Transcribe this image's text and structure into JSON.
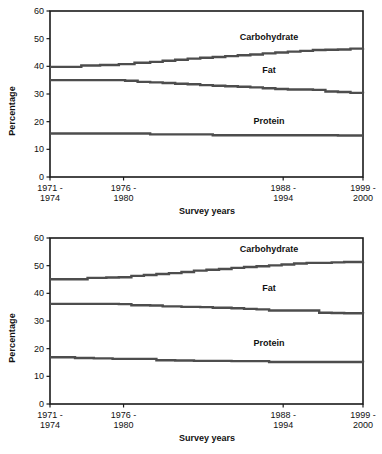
{
  "figure": {
    "panels": [
      {
        "id": "top",
        "chart_data": {
          "type": "line",
          "title": "",
          "xlabel": "Survey years",
          "ylabel": "Percentage",
          "ylim": [
            0,
            60
          ],
          "yticks": [
            0,
            10,
            20,
            30,
            40,
            50,
            60
          ],
          "grid": false,
          "legend_position": "inline-right",
          "categories": [
            "1971 - 1974",
            "1976 - 1980",
            "1988 - 1994",
            "1999 - 2000"
          ],
          "xtick_positions": [
            0.0,
            0.235,
            0.745,
            1.0
          ],
          "annotations": [
            {
              "text": "Carbohydrate",
              "x": 0.7,
              "y": 49.5
            },
            {
              "text": "Fat",
              "x": 0.7,
              "y": 37.5
            },
            {
              "text": "Protein",
              "x": 0.7,
              "y": 19.0
            }
          ],
          "series": [
            {
              "name": "Carbohydrate",
              "color": "#4d4d4d",
              "x": [
                0.0,
                0.06,
                0.1,
                0.16,
                0.22,
                0.27,
                0.32,
                0.36,
                0.4,
                0.44,
                0.48,
                0.52,
                0.56,
                0.6,
                0.64,
                0.68,
                0.72,
                0.76,
                0.8,
                0.84,
                0.88,
                0.92,
                0.96,
                1.0
              ],
              "values": [
                39.8,
                39.8,
                40.3,
                40.5,
                40.8,
                41.3,
                41.6,
                42.0,
                42.4,
                42.8,
                43.1,
                43.4,
                43.7,
                44.0,
                44.3,
                44.7,
                45.0,
                45.3,
                45.6,
                45.9,
                46.0,
                46.1,
                46.4,
                46.5
              ]
            },
            {
              "name": "Fat",
              "color": "#4d4d4d",
              "x": [
                0.0,
                0.06,
                0.12,
                0.18,
                0.24,
                0.28,
                0.32,
                0.36,
                0.4,
                0.44,
                0.48,
                0.52,
                0.56,
                0.6,
                0.64,
                0.68,
                0.72,
                0.76,
                0.8,
                0.84,
                0.88,
                0.92,
                0.96,
                1.0
              ],
              "values": [
                35.0,
                35.0,
                35.0,
                35.0,
                34.8,
                34.4,
                34.2,
                34.0,
                33.7,
                33.5,
                33.2,
                33.0,
                32.8,
                32.6,
                32.4,
                32.1,
                31.8,
                31.6,
                31.6,
                31.5,
                30.9,
                30.7,
                30.4,
                30.3
              ]
            },
            {
              "name": "Protein",
              "color": "#4d4d4d",
              "x": [
                0.0,
                0.1,
                0.2,
                0.3,
                0.32,
                0.42,
                0.5,
                0.52,
                0.62,
                0.72,
                0.82,
                0.92,
                1.0
              ],
              "values": [
                15.7,
                15.7,
                15.7,
                15.7,
                15.4,
                15.4,
                15.4,
                15.1,
                15.1,
                15.1,
                15.1,
                15.0,
                15.0
              ]
            }
          ]
        }
      },
      {
        "id": "bottom",
        "chart_data": {
          "type": "line",
          "title": "",
          "xlabel": "Survey years",
          "ylabel": "Percentage",
          "ylim": [
            0,
            60
          ],
          "yticks": [
            0,
            10,
            20,
            30,
            40,
            50,
            60
          ],
          "grid": false,
          "legend_position": "inline-right",
          "categories": [
            "1971 - 1974",
            "1976 - 1980",
            "1988 - 1994",
            "1999 - 2000"
          ],
          "xtick_positions": [
            0.0,
            0.235,
            0.745,
            1.0
          ],
          "annotations": [
            {
              "text": "Carbohydrate",
              "x": 0.7,
              "y": 55.0
            },
            {
              "text": "Fat",
              "x": 0.7,
              "y": 41.0
            },
            {
              "text": "Protein",
              "x": 0.7,
              "y": 21.0
            }
          ],
          "series": [
            {
              "name": "Carbohydrate",
              "color": "#4d4d4d",
              "x": [
                0.0,
                0.06,
                0.12,
                0.18,
                0.22,
                0.26,
                0.3,
                0.34,
                0.38,
                0.42,
                0.46,
                0.5,
                0.54,
                0.58,
                0.62,
                0.66,
                0.7,
                0.74,
                0.78,
                0.82,
                0.86,
                0.9,
                0.94,
                1.0
              ],
              "values": [
                45.1,
                45.1,
                45.6,
                45.7,
                45.8,
                46.3,
                46.6,
                47.0,
                47.3,
                47.7,
                48.2,
                48.5,
                48.8,
                49.2,
                49.5,
                49.8,
                50.1,
                50.4,
                50.8,
                51.0,
                51.0,
                51.2,
                51.3,
                51.4
              ]
            },
            {
              "name": "Fat",
              "color": "#4d4d4d",
              "x": [
                0.0,
                0.08,
                0.16,
                0.22,
                0.26,
                0.32,
                0.36,
                0.42,
                0.48,
                0.52,
                0.58,
                0.62,
                0.66,
                0.7,
                0.74,
                0.78,
                0.82,
                0.86,
                0.9,
                0.94,
                1.0
              ],
              "values": [
                36.2,
                36.2,
                36.2,
                36.1,
                35.7,
                35.6,
                35.3,
                35.1,
                35.0,
                34.8,
                34.6,
                34.4,
                34.2,
                33.8,
                33.8,
                33.8,
                33.8,
                33.0,
                32.9,
                32.8,
                32.7
              ]
            },
            {
              "name": "Protein",
              "color": "#4d4d4d",
              "x": [
                0.0,
                0.04,
                0.08,
                0.14,
                0.2,
                0.28,
                0.34,
                0.4,
                0.46,
                0.52,
                0.58,
                0.64,
                0.7,
                0.8,
                0.9,
                1.0
              ],
              "values": [
                16.9,
                16.9,
                16.6,
                16.5,
                16.3,
                16.3,
                15.8,
                15.7,
                15.6,
                15.6,
                15.5,
                15.5,
                15.2,
                15.2,
                15.2,
                15.1
              ]
            }
          ]
        }
      }
    ]
  }
}
